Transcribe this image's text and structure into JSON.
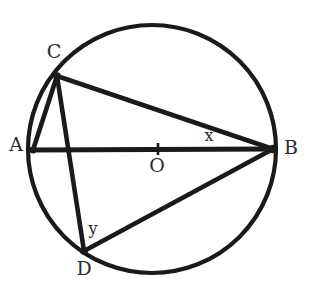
{
  "figure": {
    "background_color": "#ffffff",
    "ink_color": "#1a1a1a",
    "label_color": "#2b2b2b"
  },
  "circle": {
    "center": {
      "x": 152,
      "y": 149
    },
    "radius": 124,
    "stroke_width": 4.2
  },
  "points": [
    {
      "id": "A",
      "label": "A",
      "x": 33,
      "y": 150,
      "label_x": 16,
      "label_y": 146,
      "on_circle": true
    },
    {
      "id": "B",
      "label": "B",
      "x": 273,
      "y": 149,
      "label_x": 291,
      "label_y": 149,
      "on_circle": true
    },
    {
      "id": "C",
      "label": "C",
      "x": 57,
      "y": 76,
      "label_x": 54,
      "label_y": 53,
      "on_circle": true
    },
    {
      "id": "D",
      "label": "D",
      "x": 84,
      "y": 251,
      "label_x": 84,
      "label_y": 270,
      "on_circle": true
    },
    {
      "id": "O",
      "label": "O",
      "x": 152,
      "y": 149,
      "label_x": 157,
      "label_y": 167,
      "on_circle": false
    }
  ],
  "segments": [
    {
      "id": "AB",
      "from": "A",
      "to": "B",
      "kind": "diameter",
      "x1": 33,
      "y1": 150,
      "x2": 273,
      "y2": 149
    },
    {
      "id": "CB",
      "from": "C",
      "to": "B",
      "kind": "chord",
      "x1": 57,
      "y1": 76,
      "x2": 273,
      "y2": 149
    },
    {
      "id": "CA",
      "from": "C",
      "to": "A",
      "kind": "chord",
      "x1": 57,
      "y1": 76,
      "x2": 33,
      "y2": 150
    },
    {
      "id": "CD",
      "from": "C",
      "to": "D",
      "kind": "chord",
      "x1": 57,
      "y1": 76,
      "x2": 84,
      "y2": 251
    },
    {
      "id": "DB",
      "from": "D",
      "to": "B",
      "kind": "chord",
      "x1": 84,
      "y1": 251,
      "x2": 273,
      "y2": 149
    }
  ],
  "center_mark": {
    "type": "tick",
    "x": 158,
    "y_top": 143,
    "y_bottom": 155
  },
  "angle_labels": [
    {
      "id": "x",
      "label": "x",
      "vertex": "B",
      "x": 209,
      "y": 136
    },
    {
      "id": "y",
      "label": "y",
      "vertex": "D",
      "x": 93,
      "y": 229
    }
  ]
}
